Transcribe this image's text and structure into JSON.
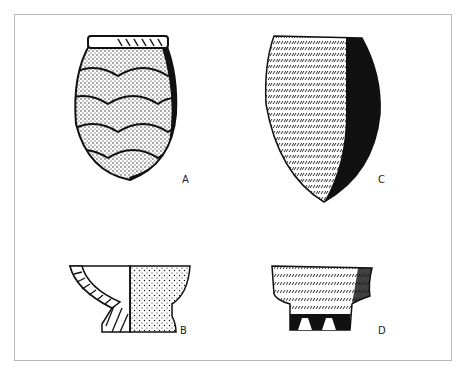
{
  "figure": {
    "type": "archaeological pottery illustration",
    "items": [
      {
        "label": "A",
        "description": "ovoid jar with scale-pattern stippled surface, incised rim band"
      },
      {
        "label": "B",
        "description": "pedestal bowl shown in half-section (hatched profile left, stippled exterior right)"
      },
      {
        "label": "C",
        "description": "pointed-base conical vessel with horizontal cord/herringbone impressions, shaded right side"
      },
      {
        "label": "D",
        "description": "fragment of pedestal base with horizontal impressed bands and cut-out foot"
      }
    ]
  },
  "colors": {
    "ink": "#111111",
    "frame": "#b8b8b8",
    "background": "#ffffff"
  }
}
